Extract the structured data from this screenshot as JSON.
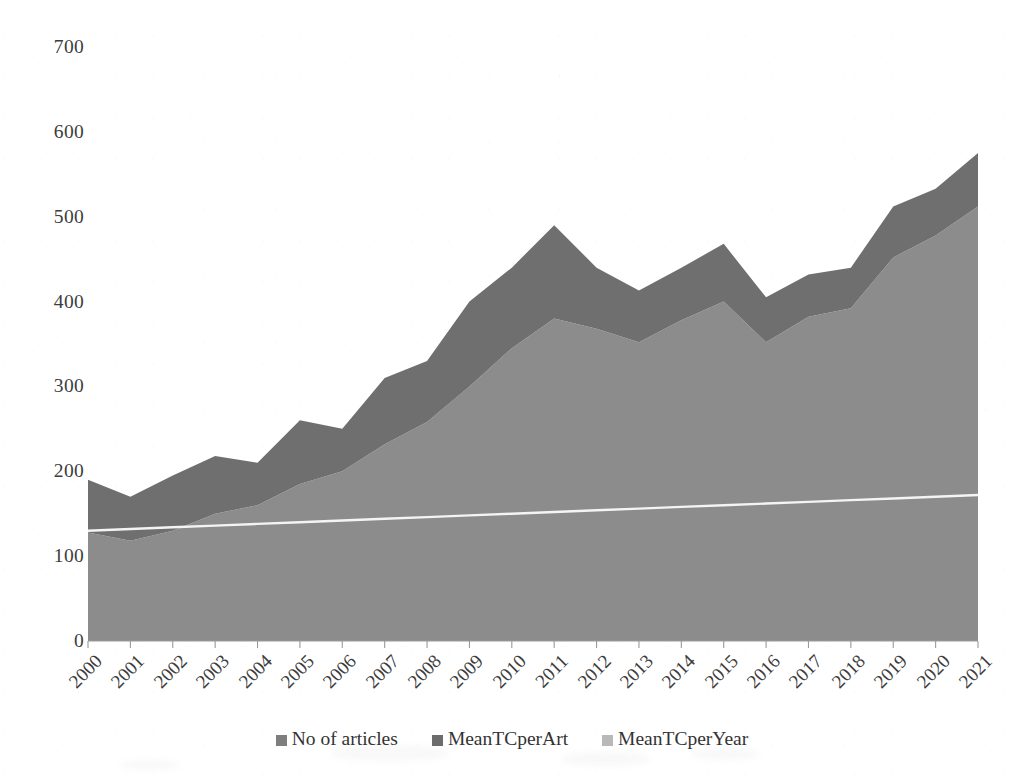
{
  "chart_data": {
    "type": "area",
    "stacked": true,
    "title": "",
    "xlabel": "",
    "ylabel": "",
    "ylim": [
      0,
      700
    ],
    "ytick_step": 100,
    "ytick_labels": [
      "700",
      "600",
      "500",
      "400",
      "300",
      "200",
      "100",
      "0"
    ],
    "ytick_values": [
      700,
      600,
      500,
      400,
      300,
      200,
      100,
      0
    ],
    "grid": false,
    "legend_position": "bottom",
    "categories": [
      "2000",
      "2001",
      "2002",
      "2003",
      "2004",
      "2005",
      "2006",
      "2007",
      "2008",
      "2009",
      "2010",
      "2011",
      "2012",
      "2013",
      "2014",
      "2015",
      "2016",
      "2017",
      "2018",
      "2019",
      "2020",
      "2021"
    ],
    "series": [
      {
        "name": "No of articles",
        "color": "#8c8c8c",
        "values": [
          128,
          118,
          130,
          150,
          160,
          185,
          200,
          232,
          258,
          300,
          345,
          380,
          368,
          352,
          378,
          400,
          352,
          382,
          392,
          452,
          478,
          512
        ]
      },
      {
        "name": "MeanTCperArt",
        "color": "#6f6f6f",
        "values": [
          62,
          52,
          65,
          68,
          50,
          75,
          50,
          78,
          72,
          100,
          95,
          110,
          72,
          61,
          62,
          68,
          53,
          50,
          48,
          60,
          55,
          63
        ]
      },
      {
        "name": "MeanTCperYear",
        "color": "#f2f2f2",
        "render": "line",
        "values": [
          130,
          132,
          134,
          136,
          138,
          140,
          142,
          144,
          146,
          148,
          150,
          152,
          154,
          156,
          158,
          160,
          162,
          164,
          166,
          168,
          170,
          172
        ]
      }
    ],
    "stack_totals": [
      190,
      170,
      195,
      218,
      210,
      260,
      250,
      310,
      330,
      400,
      440,
      490,
      440,
      413,
      440,
      468,
      405,
      432,
      440,
      512,
      533,
      575
    ]
  },
  "legend": {
    "items": [
      {
        "label": "No of articles",
        "color": "#7e7e7e"
      },
      {
        "label": "MeanTCperArt",
        "color": "#6c6c6c"
      },
      {
        "label": "MeanTCperYear",
        "color": "#b9b9b9"
      }
    ]
  },
  "axes": {
    "y_ticks": [
      "700",
      "600",
      "500",
      "400",
      "300",
      "200",
      "100",
      "0"
    ],
    "x_ticks": [
      "2000",
      "2001",
      "2002",
      "2003",
      "2004",
      "2005",
      "2006",
      "2007",
      "2008",
      "2009",
      "2010",
      "2011",
      "2012",
      "2013",
      "2014",
      "2015",
      "2016",
      "2017",
      "2018",
      "2019",
      "2020",
      "2021"
    ]
  },
  "colors": {
    "background": "#ffffff",
    "axis_line": "#9a9a9a",
    "tick": "#9a9a9a",
    "text": "#3c3c3c",
    "area_lower": "#8c8c8c",
    "area_upper": "#6f6f6f",
    "trend_line": "#f4f4f4"
  }
}
